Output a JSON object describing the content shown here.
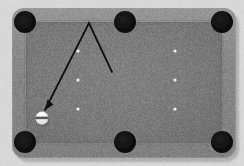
{
  "scene": {
    "title": "Billiard table bank-shot diagram",
    "width": 244,
    "height": 166,
    "background_color": "#d9d9d9"
  },
  "table": {
    "label": "pool-table",
    "rail_color": "#8b8b8b",
    "rail_shadow_color": "#6f6f6f",
    "rail_highlight_color": "#9b9b9b",
    "felt_color": "#7e7e7e",
    "outer": {
      "x": 12,
      "y": 8,
      "width": 224,
      "height": 150,
      "radius": 12
    },
    "felt": {
      "x": 26,
      "y": 22,
      "width": 196,
      "height": 121,
      "radius": 4
    }
  },
  "pockets": {
    "label": "pockets",
    "color": "#121212",
    "radius": 11,
    "items": [
      {
        "name": "pocket-top-left",
        "cx": 25,
        "cy": 22
      },
      {
        "name": "pocket-top-center",
        "cx": 125,
        "cy": 22
      },
      {
        "name": "pocket-top-right",
        "cx": 222,
        "cy": 22
      },
      {
        "name": "pocket-bottom-left",
        "cx": 25,
        "cy": 142
      },
      {
        "name": "pocket-bottom-center",
        "cx": 125,
        "cy": 142
      },
      {
        "name": "pocket-bottom-right",
        "cx": 222,
        "cy": 142
      }
    ]
  },
  "spots": {
    "label": "table-spot-markers",
    "color": "#f2f2f2",
    "radius": 1.6,
    "items": [
      {
        "name": "spot-left-top",
        "cx": 78,
        "cy": 51
      },
      {
        "name": "spot-left-middle",
        "cx": 78,
        "cy": 80
      },
      {
        "name": "spot-left-bottom",
        "cx": 78,
        "cy": 109
      },
      {
        "name": "spot-right-top",
        "cx": 175,
        "cy": 51
      },
      {
        "name": "spot-right-middle",
        "cx": 175,
        "cy": 80
      },
      {
        "name": "spot-right-bottom",
        "cx": 175,
        "cy": 109
      }
    ]
  },
  "trajectory": {
    "label": "shot-path-arrow",
    "color": "#101010",
    "stroke_width": 1.8,
    "points": "112,72 89,23 45,110",
    "start": {
      "x": 112,
      "y": 72
    },
    "apex": {
      "x": 89,
      "y": 23
    },
    "end": {
      "x": 45,
      "y": 110
    },
    "arrowhead": "45,110 47.5,99.5 53.5,104.5"
  },
  "cue_ball": {
    "label": "cue-ball",
    "cx": 42,
    "cy": 118,
    "radius": 6.4,
    "color": "#fbfbfb",
    "stripe_color": "#4a4a4a",
    "shadow_color": "#5d5d5d"
  }
}
